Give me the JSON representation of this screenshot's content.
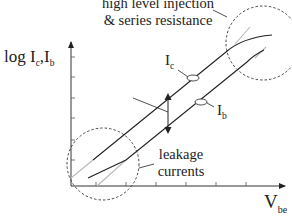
{
  "diagram": {
    "type": "semilog transistor characteristic (Gummel plot)",
    "y_axis": {
      "label_prefix": "log I",
      "label_sub1": "c",
      "label_sep": ",I",
      "label_sub2": "b"
    },
    "x_axis": {
      "label_main": "V",
      "label_sub": "be"
    },
    "curves": [
      {
        "name": "I",
        "sub": "c",
        "description": "collector current"
      },
      {
        "name": "I",
        "sub": "b",
        "description": "base current"
      }
    ],
    "annotations": {
      "high_level_line1": "high level injection",
      "high_level_line2": "& series resistance",
      "leakage_line1": "leakage",
      "leakage_line2": "currents"
    },
    "colors": {
      "curve": "#222222",
      "ideal_extension": "#b8b8b8",
      "axis": "#333333",
      "dashed_circle": "#333333"
    }
  }
}
